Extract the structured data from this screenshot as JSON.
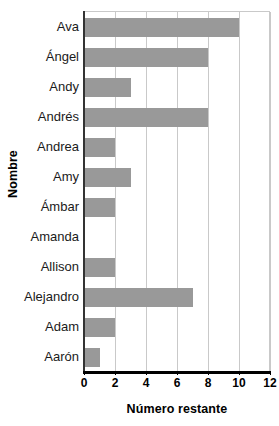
{
  "chart_data": {
    "type": "bar",
    "orientation": "horizontal",
    "title": "",
    "xlabel": "Número restante",
    "ylabel": "Nombre",
    "categories": [
      "Ava",
      "Ángel",
      "Andy",
      "Andrés",
      "Andrea",
      "Amy",
      "Ámbar",
      "Amanda",
      "Allison",
      "Alejandro",
      "Adam",
      "Aarón"
    ],
    "values": [
      10,
      8,
      3,
      8,
      2,
      3,
      2,
      0,
      2,
      7,
      2,
      1
    ],
    "xlim": [
      0,
      12
    ],
    "xticks": [
      0,
      2,
      4,
      6,
      8,
      10,
      12
    ],
    "xtick_labels": [
      "0",
      "2",
      "4",
      "6",
      "8",
      "10",
      "12"
    ],
    "grid": "vertical",
    "legend": "none",
    "bar_color": "#999999",
    "gridline_color": "#c9c9c9",
    "axis_color": "#000000",
    "background_color": "#ffffff"
  }
}
